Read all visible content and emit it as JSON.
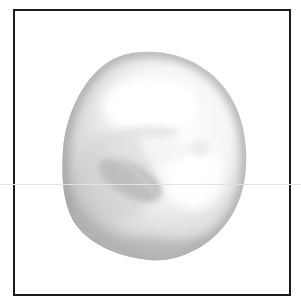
{
  "image": {
    "subject": "grayscale 3D rendered rounded blob (cell/pebble-like object)",
    "alt": "Gray shaded irregular rounded blob inside a black square frame",
    "colors": {
      "frame": "#1a1a1a",
      "background": "#ffffff",
      "blob_highlight": "#fdfdfd",
      "blob_mid": "#d8d8d8",
      "blob_shadow": "#a9a9a9",
      "guide_line": "#e2e2e2"
    }
  }
}
